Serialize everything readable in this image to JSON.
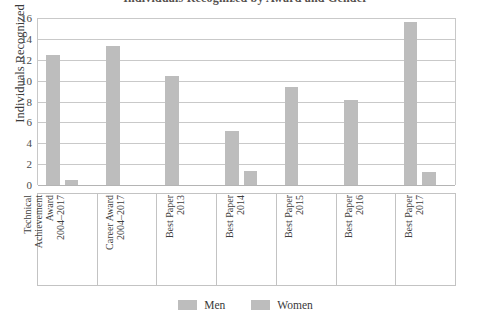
{
  "chart_data": {
    "type": "bar",
    "title": "Individuals Recognized by Award and Gender",
    "xlabel": "",
    "ylabel": "Individuals Recognized",
    "ylim": [
      0,
      16
    ],
    "yticks": [
      0,
      2,
      4,
      6,
      8,
      10,
      12,
      14,
      16
    ],
    "grid": true,
    "legend_position": "bottom",
    "categories": [
      "Technical Achievement Award 2004–2017",
      "Career Award 2004–2017",
      "Best Paper 2013",
      "Best Paper 2014",
      "Best Paper 2015",
      "Best Paper 2016",
      "Best Paper 2017"
    ],
    "category_lines": [
      [
        "Technical",
        "Achievement",
        "Award",
        "2004–2017"
      ],
      [
        "Career Award",
        "2004–2017"
      ],
      [
        "Best Paper",
        "2013"
      ],
      [
        "Best Paper",
        "2014"
      ],
      [
        "Best Paper",
        "2015"
      ],
      [
        "Best Paper",
        "2016"
      ],
      [
        "Best Paper",
        "2017"
      ]
    ],
    "series": [
      {
        "name": "Men",
        "color": "#bdbdbd",
        "values": [
          12.5,
          13.3,
          10.4,
          5.2,
          9.4,
          8.1,
          15.6
        ]
      },
      {
        "name": "Women",
        "color": "#bdbdbd",
        "values": [
          0.5,
          0,
          0,
          1.3,
          0,
          0,
          1.2
        ]
      }
    ]
  },
  "colors": {
    "men": "#bdbdbd",
    "women": "#bdbdbd",
    "gridline": "#c9c9c9",
    "axis": "#c3c3c3",
    "text": "#3a3a3a"
  }
}
